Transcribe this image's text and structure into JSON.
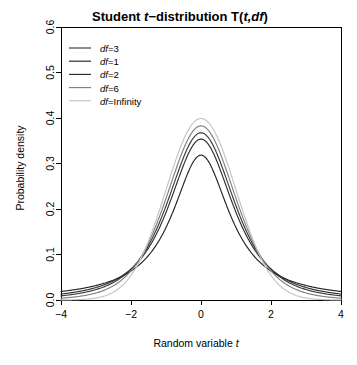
{
  "chart_data": {
    "type": "line",
    "title_parts": [
      {
        "text": "Student ",
        "italic": false
      },
      {
        "text": "t",
        "italic": true
      },
      {
        "text": "−distribution T(",
        "italic": false
      },
      {
        "text": "t,df",
        "italic": true
      },
      {
        "text": ")",
        "italic": false
      }
    ],
    "xlabel": "Random variable t",
    "xlabel_parts": [
      {
        "text": "Random variable ",
        "italic": false
      },
      {
        "text": "t",
        "italic": true
      }
    ],
    "ylabel": "Probability density",
    "xlim": [
      -4,
      4
    ],
    "ylim": [
      0,
      0.6
    ],
    "xticks": [
      -4,
      -2,
      0,
      2,
      4
    ],
    "xtick_labels": [
      "−4",
      "−2",
      "0",
      "2",
      "4"
    ],
    "yticks": [
      0.0,
      0.1,
      0.2,
      0.3,
      0.4,
      0.5,
      0.6
    ],
    "ytick_labels": [
      "0.0",
      "0.1",
      "0.2",
      "0.3",
      "0.4",
      "0.5",
      "0.6"
    ],
    "grid": false,
    "box": true,
    "legend_position": "top-left",
    "series": [
      {
        "name": "df=3",
        "label_parts": [
          {
            "text": "df",
            "italic": true
          },
          {
            "text": "=3",
            "italic": false
          }
        ],
        "df": 3,
        "color": "#3a3a3a",
        "peak": 0.3676,
        "x": [
          -4.0,
          -3.6,
          -3.2,
          -2.8,
          -2.4,
          -2.0,
          -1.6,
          -1.2,
          -0.8,
          -0.4,
          0.0,
          0.4,
          0.8,
          1.2,
          1.6,
          2.0,
          2.4,
          2.8,
          3.2,
          3.6,
          4.0
        ],
        "y": [
          0.0092,
          0.0125,
          0.0175,
          0.0253,
          0.0375,
          0.0568,
          0.0872,
          0.1333,
          0.1956,
          0.2658,
          0.3676,
          0.2658,
          0.1956,
          0.1333,
          0.0872,
          0.0568,
          0.0375,
          0.0253,
          0.0175,
          0.0125,
          0.0092
        ]
      },
      {
        "name": "df=1",
        "label_parts": [
          {
            "text": "df",
            "italic": true
          },
          {
            "text": "=1",
            "italic": false
          }
        ],
        "df": 1,
        "color": "#232323",
        "peak": 0.3183,
        "x": [
          -4.0,
          -3.6,
          -3.2,
          -2.8,
          -2.4,
          -2.0,
          -1.6,
          -1.2,
          -0.8,
          -0.4,
          0.0,
          0.4,
          0.8,
          1.2,
          1.6,
          2.0,
          2.4,
          2.8,
          3.2,
          3.6,
          4.0
        ],
        "y": [
          0.0187,
          0.0229,
          0.0287,
          0.0367,
          0.0482,
          0.0637,
          0.0868,
          0.1224,
          0.1767,
          0.244,
          0.3183,
          0.244,
          0.1767,
          0.1224,
          0.0868,
          0.0637,
          0.0482,
          0.0367,
          0.0287,
          0.0229,
          0.0187
        ]
      },
      {
        "name": "df=2",
        "label_parts": [
          {
            "text": "df",
            "italic": true
          },
          {
            "text": "=2",
            "italic": false
          }
        ],
        "df": 2,
        "color": "#2e2e2e",
        "peak": 0.3536,
        "x": [
          -4.0,
          -3.6,
          -3.2,
          -2.8,
          -2.4,
          -2.0,
          -1.6,
          -1.2,
          -0.8,
          -0.4,
          0.0,
          0.4,
          0.8,
          1.2,
          1.6,
          2.0,
          2.4,
          2.8,
          3.2,
          3.6,
          4.0
        ],
        "y": [
          0.0131,
          0.0172,
          0.0231,
          0.0317,
          0.0449,
          0.0663,
          0.1006,
          0.1524,
          0.2196,
          0.2899,
          0.3536,
          0.2899,
          0.2196,
          0.1524,
          0.1006,
          0.0663,
          0.0449,
          0.0317,
          0.0231,
          0.0172,
          0.0131
        ]
      },
      {
        "name": "df=6",
        "label_parts": [
          {
            "text": "df",
            "italic": true
          },
          {
            "text": "=6",
            "italic": false
          }
        ],
        "df": 6,
        "color": "#808080",
        "peak": 0.3827,
        "x": [
          -4.0,
          -3.6,
          -3.2,
          -2.8,
          -2.4,
          -2.0,
          -1.6,
          -1.2,
          -0.8,
          -0.4,
          0.0,
          0.4,
          0.8,
          1.2,
          1.6,
          2.0,
          2.4,
          2.8,
          3.2,
          3.6,
          4.0
        ],
        "y": [
          0.004,
          0.0063,
          0.0102,
          0.017,
          0.0288,
          0.0495,
          0.0843,
          0.1377,
          0.2103,
          0.2958,
          0.3827,
          0.2958,
          0.2103,
          0.1377,
          0.0843,
          0.0495,
          0.0288,
          0.017,
          0.0102,
          0.0063,
          0.004
        ]
      },
      {
        "name": "df=Infinity",
        "label_parts": [
          {
            "text": "df",
            "italic": true
          },
          {
            "text": "=Infinity",
            "italic": false
          }
        ],
        "df": null,
        "color": "#c4c4c4",
        "peak": 0.3989,
        "x": [
          -4.0,
          -3.6,
          -3.2,
          -2.8,
          -2.4,
          -2.0,
          -1.6,
          -1.2,
          -0.8,
          -0.4,
          0.0,
          0.4,
          0.8,
          1.2,
          1.6,
          2.0,
          2.4,
          2.8,
          3.2,
          3.6,
          4.0
        ],
        "y": [
          0.0001,
          0.0006,
          0.0024,
          0.0079,
          0.0224,
          0.054,
          0.1109,
          0.1942,
          0.2897,
          0.3683,
          0.3989,
          0.3683,
          0.2897,
          0.1942,
          0.1109,
          0.054,
          0.0224,
          0.0079,
          0.0024,
          0.0006,
          0.0001
        ]
      }
    ]
  }
}
